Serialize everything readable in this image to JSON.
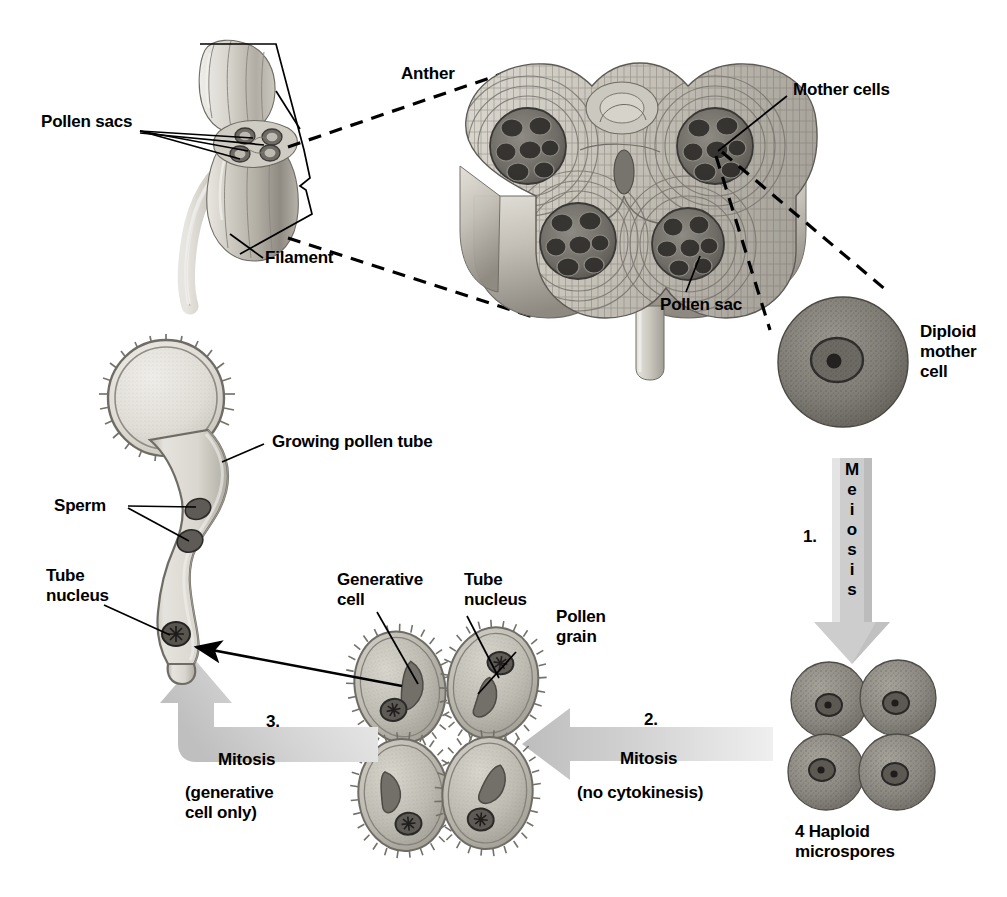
{
  "figure": {
    "background": "#ffffff",
    "ink": "#000000",
    "arrow_gray": "#c9c9c9",
    "tissue_gray": "#b9b6ae",
    "cell_gray": "#8f8d86"
  },
  "labels": {
    "anther": "Anther",
    "pollen_sacs": "Pollen sacs",
    "filament": "Filament",
    "mother_cells": "Mother cells",
    "pollen_sac": "Pollen sac",
    "diploid_mother_cell_line1": "Diploid",
    "diploid_mother_cell_line2": "mother",
    "diploid_mother_cell_line3": "cell",
    "growing_pollen_tube": "Growing pollen tube",
    "sperm": "Sperm",
    "tube_nucleus_left_line1": "Tube",
    "tube_nucleus_left_line2": "nucleus",
    "generative_cell_line1": "Generative",
    "generative_cell_line2": "cell",
    "tube_nucleus_mid_line1": "Tube",
    "tube_nucleus_mid_line2": "nucleus",
    "pollen_grain_line1": "Pollen",
    "pollen_grain_line2": "grain",
    "haploid_microspores_line1": "4 Haploid",
    "haploid_microspores_line2": "microspores"
  },
  "steps": [
    {
      "number": "1.",
      "name": "Meiosis",
      "letters": [
        "M",
        "e",
        "i",
        "o",
        "s",
        "i",
        "s"
      ],
      "qualifier": "",
      "direction": "down",
      "orientation": "vertical"
    },
    {
      "number": "2.",
      "name": "Mitosis",
      "qualifier": "(no cytokinesis)",
      "direction": "left",
      "orientation": "horizontal"
    },
    {
      "number": "3.",
      "name": "Mitosis",
      "qualifier_line1": "(generative",
      "qualifier_line2": "cell only)",
      "direction": "up",
      "orientation": "elbow"
    }
  ]
}
